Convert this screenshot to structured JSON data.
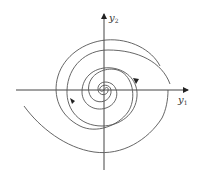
{
  "diagram": {
    "type": "phase-portrait",
    "axes": {
      "x_label": {
        "base": "y",
        "sub": "1"
      },
      "y_label": {
        "base": "y",
        "sub": "2"
      }
    },
    "trajectory": {
      "shape": "two-armed spiral",
      "arrows": 2
    },
    "colors": {
      "stroke": "#444444",
      "background": "#ffffff"
    }
  }
}
